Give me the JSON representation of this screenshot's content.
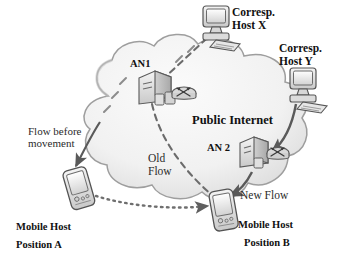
{
  "figure": {
    "type": "network-topology-diagram",
    "background_color": "#ffffff",
    "palette": {
      "cloud_fill": "#f2f2f2",
      "cloud_edge": "#9a9a9a",
      "device_fill": "#e3e3e3",
      "device_edge": "#5a5a5a",
      "line_color": "#6b6b6b",
      "text_color": "#111111"
    }
  },
  "labels": {
    "cloud": "Public Internet",
    "an1": "AN1",
    "an2": "AN 2",
    "corresp_host_x_line1": "Corresp.",
    "corresp_host_x_line2": "Host X",
    "corresp_host_y_line1": "Corresp.",
    "corresp_host_y_line2": "Host Y",
    "flow_before_line1": "Flow before",
    "flow_before_line2": "movement",
    "old_flow_line1": "Old",
    "old_flow_line2": "Flow",
    "new_flow": "New Flow",
    "mobile_host_a_line1": "Mobile Host",
    "mobile_host_a_line2": "Position A",
    "mobile_host_b_line1": "Mobile Host",
    "mobile_host_b_line2": "Position B"
  },
  "nodes": [
    {
      "id": "an1",
      "name": "AN1",
      "kind": "access-node-server-router",
      "inside_cloud": true
    },
    {
      "id": "an2",
      "name": "AN 2",
      "kind": "access-node-server-router",
      "inside_cloud": true
    },
    {
      "id": "host-x",
      "name": "Corresp. Host X",
      "kind": "desktop-computer",
      "inside_cloud": false
    },
    {
      "id": "host-y",
      "name": "Corresp. Host Y",
      "kind": "desktop-computer",
      "inside_cloud": false
    },
    {
      "id": "mh-a",
      "name": "Mobile Host Position A",
      "kind": "handheld-device",
      "inside_cloud": false
    },
    {
      "id": "mh-b",
      "name": "Mobile Host Position B",
      "kind": "handheld-device",
      "inside_cloud": false
    }
  ],
  "links": [
    {
      "id": "old-flow-upper",
      "from": "an1",
      "to": "host-x",
      "style": "dashed"
    },
    {
      "id": "old-flow-lower",
      "from": "an1",
      "to": "mh-b",
      "style": "dashed",
      "label": "Old Flow"
    },
    {
      "id": "flow-before-movement",
      "from": "cloud",
      "to": "mh-a",
      "style": "solid-arrow",
      "label": "Flow before movement"
    },
    {
      "id": "new-flow-host-y",
      "from": "host-y",
      "to": "an2",
      "style": "solid-arrow"
    },
    {
      "id": "new-flow-mobile",
      "from": "an2",
      "to": "mh-b",
      "style": "solid-arrow",
      "label": "New Flow"
    },
    {
      "id": "movement-path",
      "from": "mh-a",
      "to": "mh-b",
      "style": "dotted-arrow"
    }
  ]
}
